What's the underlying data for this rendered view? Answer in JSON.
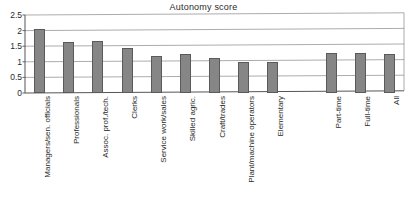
{
  "chart_data": {
    "type": "bar",
    "title": "Autonomy score",
    "xlabel": "",
    "ylabel": "",
    "ylim": [
      0,
      2.5
    ],
    "grid": true,
    "legend": "none",
    "y_ticks": [
      "0",
      "0.5",
      "1",
      "1.5",
      "2",
      "2.5"
    ],
    "y_tick_values": [
      0,
      0.5,
      1,
      1.5,
      2,
      2.5
    ],
    "categories": [
      "Managers/sen. officials",
      "Professionals",
      "Assoc. prof./tech.",
      "Clerks",
      "Service work/sales",
      "Skilled agric.",
      "Craft/trades",
      "Plant/machine operators",
      "Elementary",
      "",
      "Part-time",
      "Full-time",
      "All"
    ],
    "values": [
      2.05,
      1.65,
      1.66,
      1.45,
      1.2,
      1.24,
      1.12,
      1.0,
      1.0,
      null,
      1.27,
      1.28,
      1.26
    ],
    "bar_color": "#868686",
    "bar_border_color": "#5a5a5a",
    "axis_color": "#555555",
    "grid_color": "#888888"
  }
}
